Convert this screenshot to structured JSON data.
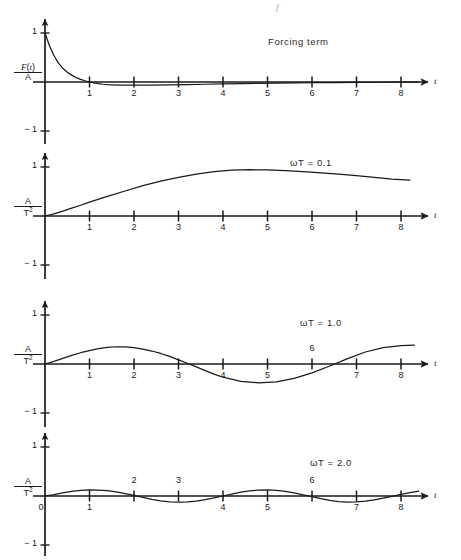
{
  "figure": {
    "stray_mark": "f",
    "background": "#ffffff",
    "ink": "#1a1a1a"
  },
  "panels": [
    {
      "id": "forcing-term",
      "caption": "Forcing term",
      "caption_x": 268,
      "caption_y": 36,
      "y_axis_label": {
        "numerator": "F(t)",
        "denominator": "A"
      },
      "t_label": "t",
      "y_ticks": [
        {
          "label": "1",
          "value": 1
        },
        {
          "label": "-1",
          "value": -1
        }
      ],
      "x_ticks": [
        "1",
        "2",
        "3",
        "4",
        "5",
        "6",
        "7",
        "8"
      ],
      "x_tick_above": [],
      "show_zero_label": false,
      "chart_data": {
        "type": "line",
        "title": "Forcing term",
        "xlabel": "t",
        "ylabel": "F(t)/A",
        "xlim": [
          0,
          8.8
        ],
        "ylim": [
          -1.15,
          1.15
        ],
        "grid": false,
        "legend": "none",
        "x": [
          0,
          0.1,
          0.2,
          0.3,
          0.4,
          0.5,
          0.6,
          0.7,
          0.8,
          0.9,
          1.0,
          1.1,
          1.2,
          1.3,
          1.4,
          1.5,
          1.7,
          2.0,
          2.4,
          2.8,
          3.2,
          3.6,
          4.0,
          4.4,
          4.8,
          5.2,
          5.6,
          6.0,
          6.5,
          7.0,
          7.5,
          8.0,
          8.4
        ],
        "y": [
          1.0,
          0.74,
          0.54,
          0.39,
          0.28,
          0.2,
          0.14,
          0.09,
          0.055,
          0.025,
          0.0,
          -0.02,
          -0.035,
          -0.046,
          -0.053,
          -0.058,
          -0.064,
          -0.066,
          -0.063,
          -0.058,
          -0.052,
          -0.046,
          -0.04,
          -0.034,
          -0.028,
          -0.023,
          -0.019,
          -0.015,
          -0.011,
          -0.008,
          -0.005,
          -0.003,
          -0.002
        ]
      }
    },
    {
      "id": "omega-t-0-1",
      "caption": "ωT = 0.1",
      "caption_x": 290,
      "caption_y": 157,
      "y_axis_label": {
        "numerator": "A",
        "denominator": "T2"
      },
      "t_label": "t",
      "y_ticks": [
        {
          "label": "1",
          "value": 1
        },
        {
          "label": "-1",
          "value": -1
        }
      ],
      "x_ticks": [
        "1",
        "2",
        "3",
        "4",
        "5",
        "6",
        "7",
        "8"
      ],
      "x_tick_above": [],
      "show_zero_label": false,
      "chart_data": {
        "type": "line",
        "title": "ωT = 0.1",
        "xlabel": "t",
        "ylabel": "A/T^2",
        "xlim": [
          0,
          8.8
        ],
        "ylim": [
          -1.15,
          1.15
        ],
        "grid": false,
        "legend": "none",
        "x": [
          0,
          0.2,
          0.4,
          0.6,
          0.8,
          1.0,
          1.4,
          1.8,
          2.2,
          2.6,
          3.0,
          3.4,
          3.8,
          4.2,
          4.6,
          5.0,
          5.4,
          5.8,
          6.2,
          6.6,
          7.0,
          7.4,
          7.8,
          8.2
        ],
        "y": [
          0.0,
          0.045,
          0.1,
          0.16,
          0.22,
          0.285,
          0.4,
          0.51,
          0.62,
          0.71,
          0.79,
          0.855,
          0.905,
          0.935,
          0.945,
          0.94,
          0.925,
          0.905,
          0.88,
          0.855,
          0.825,
          0.79,
          0.755,
          0.73
        ]
      }
    },
    {
      "id": "omega-t-1-0",
      "caption": "ωT = 1.0",
      "caption_x": 300,
      "caption_y": 317,
      "y_axis_label": {
        "numerator": "A",
        "denominator": "T2"
      },
      "t_label": "t",
      "y_ticks": [
        {
          "label": "1",
          "value": 1
        },
        {
          "label": "-1",
          "value": -1
        }
      ],
      "x_ticks": [
        "1",
        "2",
        "3",
        "4",
        "5",
        "6",
        "7",
        "8"
      ],
      "x_tick_above": [
        "6"
      ],
      "show_zero_label": false,
      "chart_data": {
        "type": "line",
        "title": "ωT = 1.0",
        "xlabel": "t",
        "ylabel": "A/T^2",
        "xlim": [
          0,
          8.8
        ],
        "ylim": [
          -1.15,
          1.15
        ],
        "grid": false,
        "legend": "none",
        "x": [
          0,
          0.2,
          0.4,
          0.6,
          0.8,
          1.0,
          1.2,
          1.4,
          1.6,
          1.8,
          2.0,
          2.2,
          2.4,
          2.6,
          2.8,
          3.0,
          3.2,
          3.4,
          3.6,
          3.8,
          4.0,
          4.4,
          4.8,
          5.2,
          5.6,
          6.0,
          6.4,
          6.8,
          7.2,
          7.6,
          8.0,
          8.3
        ],
        "y": [
          0.0,
          0.055,
          0.115,
          0.175,
          0.23,
          0.275,
          0.315,
          0.34,
          0.352,
          0.35,
          0.335,
          0.305,
          0.265,
          0.215,
          0.155,
          0.085,
          0.015,
          -0.06,
          -0.135,
          -0.205,
          -0.27,
          -0.355,
          -0.385,
          -0.365,
          -0.295,
          -0.18,
          -0.04,
          0.11,
          0.245,
          0.335,
          0.375,
          0.385
        ]
      }
    },
    {
      "id": "omega-t-2-0",
      "caption": "ωT = 2.0",
      "caption_x": 310,
      "caption_y": 457,
      "y_axis_label": {
        "numerator": "A",
        "denominator": "T2"
      },
      "t_label": "t",
      "y_ticks": [
        {
          "label": "1",
          "value": 1
        },
        {
          "label": "-1",
          "value": -1
        }
      ],
      "x_ticks": [
        "1",
        "2",
        "3",
        "4",
        "5",
        "6",
        "7",
        "8"
      ],
      "x_tick_above": [
        "2",
        "3",
        "6"
      ],
      "show_zero_label": true,
      "zero_label": "0",
      "chart_data": {
        "type": "line",
        "title": "ωT = 2.0",
        "xlabel": "t",
        "ylabel": "A/T^2",
        "xlim": [
          0,
          8.8
        ],
        "ylim": [
          -1.15,
          1.15
        ],
        "grid": false,
        "legend": "none",
        "period": 3.14,
        "amplitude": 0.125,
        "x": [
          0,
          0.2,
          0.4,
          0.6,
          0.8,
          1.0,
          1.2,
          1.4,
          1.6,
          1.8,
          2.0,
          2.2,
          2.4,
          2.6,
          2.8,
          3.0,
          3.2,
          3.4,
          3.6,
          3.8,
          4.0,
          4.2,
          4.4,
          4.6,
          4.8,
          5.0,
          5.2,
          5.4,
          5.6,
          5.8,
          6.0,
          6.2,
          6.4,
          6.6,
          6.8,
          7.0,
          7.2,
          7.4,
          7.6,
          7.8,
          8.0,
          8.2,
          8.4
        ],
        "y": [
          0.0,
          0.03,
          0.065,
          0.095,
          0.115,
          0.125,
          0.122,
          0.11,
          0.085,
          0.05,
          0.012,
          -0.03,
          -0.068,
          -0.098,
          -0.118,
          -0.125,
          -0.12,
          -0.103,
          -0.075,
          -0.04,
          0.0,
          0.04,
          0.077,
          0.105,
          0.122,
          0.125,
          0.115,
          0.093,
          0.062,
          0.025,
          -0.015,
          -0.055,
          -0.09,
          -0.113,
          -0.124,
          -0.122,
          -0.107,
          -0.08,
          -0.045,
          -0.008,
          0.032,
          0.068,
          0.098
        ]
      }
    }
  ]
}
